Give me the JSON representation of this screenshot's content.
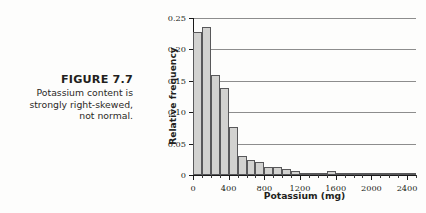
{
  "caption": {
    "figure_number": "FIGURE 7.7",
    "lines": [
      "Potassium content is",
      "strongly right-skewed,",
      "not normal."
    ]
  },
  "chart_data": {
    "type": "bar",
    "title": "",
    "xlabel": "Potassium (mg)",
    "ylabel": "Relative frequency",
    "xlim": [
      0,
      2500
    ],
    "ylim": [
      0,
      0.25
    ],
    "grid": true,
    "legend": null,
    "bin_width": 100,
    "y_ticks": [
      0,
      0.05,
      0.1,
      0.15,
      0.2,
      0.25
    ],
    "y_tick_labels": [
      "0",
      "0.05",
      "0.10",
      "0.15",
      "0.20",
      "0.25"
    ],
    "x_ticks": [
      0,
      400,
      800,
      1200,
      1600,
      2000,
      2400
    ],
    "x_tick_labels": [
      "0",
      "400",
      "800",
      "1200",
      "1600",
      "2000",
      "2400"
    ],
    "x_minor_tick_step": 100,
    "bar_fill": "#d2d2d0",
    "bar_stroke": "#58585a",
    "categories": [
      "0-100",
      "100-200",
      "200-300",
      "300-400",
      "400-500",
      "500-600",
      "600-700",
      "700-800",
      "800-900",
      "900-1000",
      "1000-1100",
      "1100-1200",
      "1200-1300",
      "1300-1400",
      "1400-1500",
      "1500-1600",
      "1600-1700",
      "1700-1800",
      "1800-1900",
      "1900-2000",
      "2000-2100",
      "2100-2200",
      "2200-2300",
      "2300-2400",
      "2400-2500"
    ],
    "bin_starts": [
      0,
      100,
      200,
      300,
      400,
      500,
      600,
      700,
      800,
      900,
      1000,
      1100,
      1200,
      1300,
      1400,
      1500,
      1600,
      1700,
      1800,
      1900,
      2000,
      2100,
      2200,
      2300,
      2400
    ],
    "values": [
      0.228,
      0.235,
      0.16,
      0.138,
      0.077,
      0.03,
      0.024,
      0.02,
      0.013,
      0.012,
      0.009,
      0.007,
      0.004,
      0.003,
      0.003,
      0.006,
      0.002,
      0.002,
      0.002,
      0.004,
      0.002,
      0.001,
      0.001,
      0.001,
      0.004
    ]
  }
}
